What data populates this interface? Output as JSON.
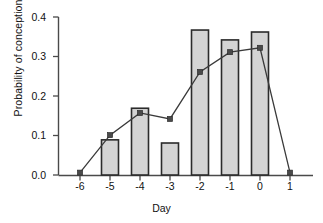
{
  "chart_data": {
    "type": "bar",
    "title": "",
    "xlabel": "Day",
    "ylabel": "Probability of conception",
    "categories": [
      "-6",
      "-5",
      "-4",
      "-3",
      "-2",
      "-1",
      "0",
      "1"
    ],
    "x": [
      -6,
      -5,
      -4,
      -3,
      -2,
      -1,
      0,
      1
    ],
    "ylim": [
      0.0,
      0.4
    ],
    "yticks": [
      0.0,
      0.1,
      0.2,
      0.3,
      0.4
    ],
    "ytick_labels": [
      "0.0",
      "0.1",
      "0.2",
      "0.3",
      "0.4"
    ],
    "grid": false,
    "legend": "none",
    "series": [
      {
        "name": "bars",
        "type": "bar",
        "categories": [
          "-6",
          "-5",
          "-4",
          "-3",
          "-2",
          "-1",
          "0",
          "1"
        ],
        "values": [
          0.0,
          0.089,
          0.169,
          0.081,
          0.367,
          0.342,
          0.362,
          0.0
        ],
        "fill_color": "#d4d4d4",
        "edge_color": "#2b2b2b"
      },
      {
        "name": "line",
        "type": "line",
        "categories": [
          "-6",
          "-5",
          "-4",
          "-3",
          "-2",
          "-1",
          "0",
          "1"
        ],
        "values": [
          0.006,
          0.101,
          0.157,
          0.142,
          0.261,
          0.311,
          0.322,
          0.006
        ],
        "line_color": "#3a3a3a",
        "marker": "square",
        "marker_color": "#4a4a4a"
      }
    ]
  },
  "axes": {
    "y_title": "Probability of conception",
    "x_title": "Day",
    "y_tick_labels": [
      "0.4",
      "0.3",
      "0.2",
      "0.1",
      "0.0"
    ],
    "x_tick_labels": [
      "-6",
      "-5",
      "-4",
      "-3",
      "-2",
      "-1",
      "0",
      "1"
    ]
  },
  "colors": {
    "axis": "#4a4a4a",
    "bar_fill": "#d4d4d4",
    "bar_edge": "#2b2b2b",
    "line": "#3a3a3a",
    "marker": "#4a4a4a",
    "background": "#ffffff",
    "text": "#111111"
  }
}
